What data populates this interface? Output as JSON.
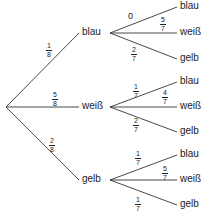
{
  "tree": {
    "root": {
      "x": 6,
      "y": 107
    },
    "level1": [
      {
        "label": "blau",
        "x": 82,
        "y": 33,
        "prob": {
          "num": "1",
          "den": "8"
        },
        "prob_pos": {
          "x": 46,
          "y": 42
        }
      },
      {
        "label": "weiß",
        "x": 82,
        "y": 107,
        "prob": {
          "num": "5",
          "den": "8"
        },
        "prob_pos": {
          "x": 52,
          "y": 91
        }
      },
      {
        "label": "gelb",
        "x": 82,
        "y": 180,
        "prob": {
          "num": "2",
          "den": "8"
        },
        "prob_pos": {
          "x": 49,
          "y": 137
        }
      }
    ],
    "level2": [
      {
        "parent": 0,
        "label": "blau",
        "x": 180,
        "y": 7,
        "prob": {
          "text": "0"
        },
        "prob_pos": {
          "x": 128,
          "y": 12
        }
      },
      {
        "parent": 0,
        "label": "weiß",
        "x": 180,
        "y": 33,
        "prob": {
          "num": "5",
          "den": "7"
        },
        "prob_pos": {
          "x": 160,
          "y": 16
        }
      },
      {
        "parent": 0,
        "label": "gelb",
        "x": 180,
        "y": 59,
        "prob": {
          "num": "2",
          "den": "7"
        },
        "prob_pos": {
          "x": 131,
          "y": 46
        }
      },
      {
        "parent": 1,
        "label": "blau",
        "x": 180,
        "y": 82,
        "prob": {
          "num": "1",
          "den": "7"
        },
        "prob_pos": {
          "x": 133,
          "y": 83
        }
      },
      {
        "parent": 1,
        "label": "weiß",
        "x": 180,
        "y": 107,
        "prob": {
          "num": "4",
          "den": "7"
        },
        "prob_pos": {
          "x": 162,
          "y": 89
        }
      },
      {
        "parent": 1,
        "label": "gelb",
        "x": 180,
        "y": 132,
        "prob": {
          "num": "2",
          "den": "7"
        },
        "prob_pos": {
          "x": 133,
          "y": 117
        }
      },
      {
        "parent": 2,
        "label": "blau",
        "x": 180,
        "y": 155,
        "prob": {
          "num": "1",
          "den": "7"
        },
        "prob_pos": {
          "x": 135,
          "y": 150
        }
      },
      {
        "parent": 2,
        "label": "weiß",
        "x": 180,
        "y": 180,
        "prob": {
          "num": "5",
          "den": "7"
        },
        "prob_pos": {
          "x": 162,
          "y": 165
        }
      },
      {
        "parent": 2,
        "label": "gelb",
        "x": 180,
        "y": 205,
        "prob": {
          "num": "1",
          "den": "7"
        },
        "prob_pos": {
          "x": 135,
          "y": 196
        }
      }
    ]
  }
}
